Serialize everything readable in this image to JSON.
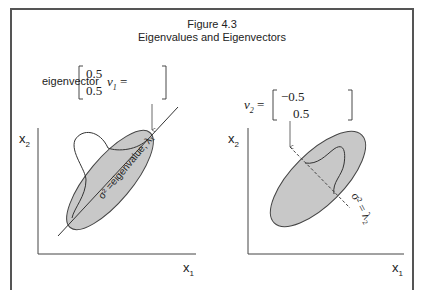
{
  "figure": {
    "number_label": "Figure 4.3",
    "title": "Eigenvalues and Eigenvectors"
  },
  "left_panel": {
    "caption": "eigenvector",
    "vector_name": "v",
    "vector_subscript": "1",
    "vector_values": [
      "0.5",
      "0.5"
    ],
    "axis_y_label": "x",
    "axis_y_sub": "2",
    "axis_x_label": "x",
    "axis_x_sub": "1",
    "line_label": "σ² =eigenvalue, λ₁",
    "line_style": "solid"
  },
  "right_panel": {
    "vector_name": "v",
    "vector_subscript": "2",
    "vector_values": [
      "−0.5",
      "0.5"
    ],
    "axis_y_label": "x",
    "axis_y_sub": "2",
    "axis_x_label": "x",
    "axis_x_sub": "1",
    "line_label": "σ² = λ₂",
    "line_style": "dashed"
  },
  "colors": {
    "frame": "#555555",
    "ellipse_fill": "#c8c8c8",
    "stroke": "#333333",
    "background": "#ffffff"
  }
}
